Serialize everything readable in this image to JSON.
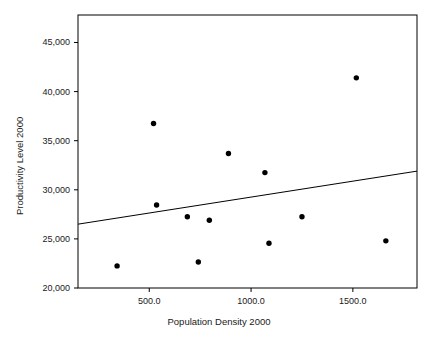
{
  "chart_data": {
    "type": "scatter",
    "title": "",
    "xlabel": "Population Density 2000",
    "ylabel": "Productivity Level 2000",
    "xlim": [
      150,
      1815
    ],
    "ylim": [
      20000,
      47800
    ],
    "grid": false,
    "legend": null,
    "xticks": [
      500,
      1000,
      1500
    ],
    "xtick_labels": [
      "500.0",
      "1000.0",
      "1500.0"
    ],
    "yticks": [
      20000,
      25000,
      30000,
      35000,
      40000,
      45000
    ],
    "ytick_labels": [
      "20,000",
      "25,000",
      "30,000",
      "35,000",
      "40,000",
      "45,000"
    ],
    "marker": {
      "shape": "circle",
      "color": "#000000",
      "size": 5
    },
    "points": [
      {
        "x": 342,
        "y": 22250
      },
      {
        "x": 521,
        "y": 36750
      },
      {
        "x": 536,
        "y": 28450
      },
      {
        "x": 687,
        "y": 27250
      },
      {
        "x": 795,
        "y": 26900
      },
      {
        "x": 741,
        "y": 22650
      },
      {
        "x": 889,
        "y": 33700
      },
      {
        "x": 1068,
        "y": 31750
      },
      {
        "x": 1088,
        "y": 24550
      },
      {
        "x": 1250,
        "y": 27250
      },
      {
        "x": 1517,
        "y": 41400
      },
      {
        "x": 1662,
        "y": 24800
      }
    ],
    "fit_line": {
      "type": "linear",
      "color": "#000000",
      "x_start": 150,
      "y_start": 26500,
      "x_end": 1815,
      "y_end": 31900
    }
  },
  "axes": {
    "frame_color": "#000000",
    "frame_left": 78,
    "frame_right": 417,
    "frame_top": 15,
    "frame_bottom": 288
  }
}
